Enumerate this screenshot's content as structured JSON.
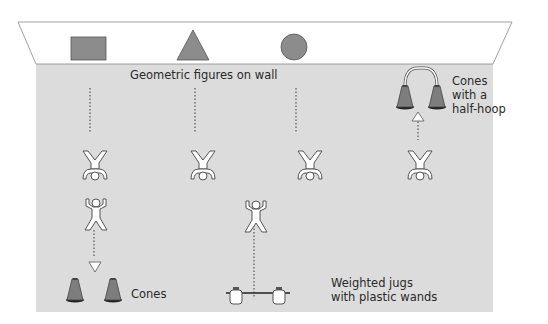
{
  "colors": {
    "floor": "#dcdcdc",
    "wall": "#ffffff",
    "shape_fill": "#8c8c8c",
    "outline": "#555555",
    "cone_fill": "#7d7d7d",
    "dotted_line": "#555555"
  },
  "wall": {
    "label": "Geometric figures on wall",
    "shapes": [
      "rectangle",
      "triangle",
      "circle"
    ]
  },
  "labels": {
    "cones_hoop": "Cones\nwith a\nhalf-hoop",
    "cones": "Cones",
    "jugs": "Weighted jugs\nwith plastic wands"
  },
  "stations": [
    {
      "name": "rectangle-station",
      "x": 90,
      "figures": [
        "inverted-bridge",
        "jumping-jack"
      ],
      "equipment": "cones"
    },
    {
      "name": "triangle-station",
      "x": 195,
      "figures": [
        "inverted-bridge"
      ],
      "equipment": "none"
    },
    {
      "name": "circle-station",
      "x": 296,
      "figures": [
        "inverted-bridge"
      ],
      "equipment": "none"
    },
    {
      "name": "hoop-station",
      "x": 418,
      "figures": [
        "inverted-bridge"
      ],
      "equipment": "cones-with-half-hoop"
    },
    {
      "name": "jugs-station",
      "x": 254,
      "figures": [
        "jumping-jack"
      ],
      "equipment": "weighted-jugs"
    }
  ]
}
